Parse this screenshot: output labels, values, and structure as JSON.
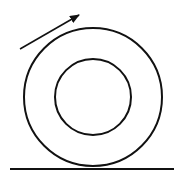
{
  "diagram": {
    "colors": {
      "stroke": "#111111",
      "background": "#ffffff"
    },
    "outer_circle": {
      "cx": 93,
      "cy": 97,
      "r": 69
    },
    "inner_circle": {
      "cx": 93,
      "cy": 97,
      "r": 38
    },
    "ground_line": {
      "x1": 10,
      "y1": 169,
      "x2": 174,
      "y2": 169
    },
    "arrow": {
      "x1": 20,
      "y1": 49,
      "x2": 79,
      "y2": 15
    }
  }
}
